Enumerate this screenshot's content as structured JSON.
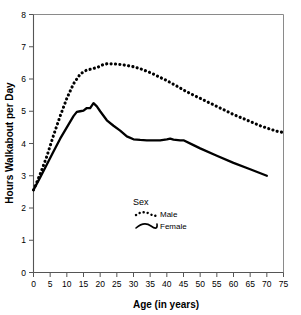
{
  "chart_data": {
    "type": "line",
    "title": "",
    "xlabel": "Age (in years)",
    "ylabel": "Hours Walkabout per Day",
    "xlim": [
      0,
      75
    ],
    "ylim": [
      0,
      8
    ],
    "xticks": [
      0,
      5,
      10,
      15,
      20,
      25,
      30,
      35,
      40,
      45,
      50,
      55,
      60,
      65,
      70,
      75
    ],
    "yticks": [
      0,
      1,
      2,
      3,
      4,
      5,
      6,
      7,
      8
    ],
    "grid": false,
    "legend": {
      "title": "Sex",
      "position": "inside-lower-center",
      "entries": [
        {
          "name": "Male",
          "style": "dotted"
        },
        {
          "name": "Female",
          "style": "solid"
        }
      ]
    },
    "series": [
      {
        "name": "Male",
        "style": "dotted",
        "color": "#000000",
        "x": [
          0,
          2,
          4,
          6,
          8,
          10,
          12,
          14,
          15,
          16,
          17,
          18,
          19,
          20,
          21,
          22,
          24,
          26,
          28,
          30,
          32,
          35,
          38,
          40,
          43,
          45,
          48,
          50,
          53,
          55,
          58,
          60,
          63,
          65,
          68,
          70,
          73,
          75
        ],
        "y": [
          2.56,
          3.05,
          3.6,
          4.25,
          4.85,
          5.4,
          5.85,
          6.15,
          6.22,
          6.28,
          6.3,
          6.33,
          6.35,
          6.4,
          6.45,
          6.47,
          6.47,
          6.45,
          6.42,
          6.38,
          6.32,
          6.2,
          6.05,
          5.95,
          5.78,
          5.66,
          5.5,
          5.4,
          5.25,
          5.15,
          5.0,
          4.9,
          4.77,
          4.68,
          4.55,
          4.48,
          4.38,
          4.34
        ]
      },
      {
        "name": "Female",
        "style": "solid",
        "color": "#000000",
        "x": [
          0,
          2,
          4,
          6,
          8,
          10,
          12,
          13,
          14,
          15,
          16,
          17,
          18,
          19,
          20,
          22,
          24,
          26,
          28,
          30,
          32,
          34,
          36,
          38,
          40,
          41,
          42,
          44,
          45,
          48,
          50,
          55,
          60,
          65,
          70
        ],
        "y": [
          2.56,
          2.95,
          3.35,
          3.75,
          4.15,
          4.5,
          4.85,
          4.98,
          5.0,
          5.02,
          5.1,
          5.1,
          5.25,
          5.15,
          5.0,
          4.72,
          4.55,
          4.4,
          4.22,
          4.13,
          4.11,
          4.1,
          4.1,
          4.1,
          4.13,
          4.15,
          4.12,
          4.1,
          4.1,
          3.95,
          3.85,
          3.62,
          3.4,
          3.2,
          3.0
        ]
      }
    ]
  }
}
